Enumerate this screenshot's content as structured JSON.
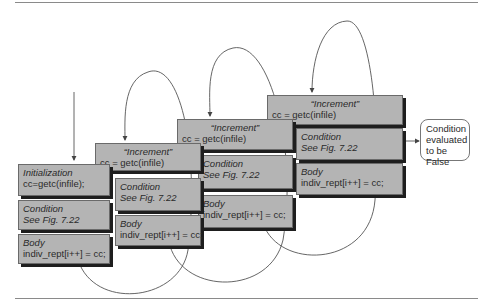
{
  "figure": {
    "columns": [
      {
        "first": {
          "title": "Initialization",
          "code": "cc=getc(infile);"
        },
        "condition": {
          "title": "Condition",
          "code": "See Fig. 7.22"
        },
        "body": {
          "title": "Body",
          "code": "indiv_rept[i++] = cc;"
        }
      },
      {
        "first": {
          "title": "“Increment”",
          "code": "cc = getc(infile)"
        },
        "condition": {
          "title": "Condition",
          "code": "See Fig. 7.22"
        },
        "body": {
          "title": "Body",
          "code": "indiv_rept[i++] = cc;"
        }
      },
      {
        "first": {
          "title": "“Increment”",
          "code": "cc = getc(infile)"
        },
        "condition": {
          "title": "Condition",
          "code": "See Fig. 7.22"
        },
        "body": {
          "title": "Body",
          "code": "indiv_rept[i++] = cc;"
        }
      },
      {
        "first": {
          "title": "“Increment”",
          "code": "cc = getc(infile)"
        },
        "condition": {
          "title": "Condition",
          "code": "See Fig. 7.22"
        },
        "body": {
          "title": "Body",
          "code": "indiv_rept[i++] = cc;"
        }
      }
    ],
    "exit": {
      "line1": "Condition",
      "line2": "evaluated",
      "line3": "to be False"
    },
    "colors": {
      "box_fill": "#b4b4b4",
      "box_shadow": "#1e1e1e",
      "line": "#555555"
    }
  }
}
